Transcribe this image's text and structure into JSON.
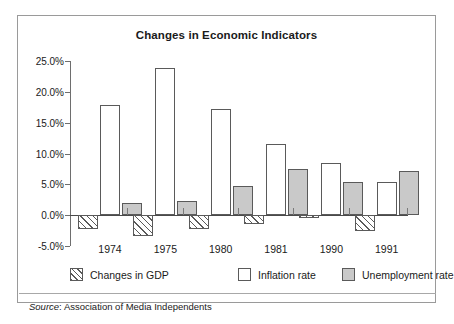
{
  "chart_data": {
    "type": "bar",
    "title": "Changes in Economic Indicators",
    "xlabel": "",
    "ylabel": "",
    "categories": [
      "1974",
      "1975",
      "1980",
      "1981",
      "1990",
      "1991"
    ],
    "series": [
      {
        "name": "Changes in GDP",
        "values": [
          -2.2,
          -3.3,
          -2.2,
          -1.5,
          -0.4,
          -2.6
        ],
        "fill": "hatched"
      },
      {
        "name": "Inflation rate",
        "values": [
          17.9,
          23.9,
          17.2,
          11.5,
          8.4,
          5.4
        ],
        "fill": "white"
      },
      {
        "name": "Unemployment rate",
        "values": [
          2.0,
          2.3,
          4.7,
          7.5,
          5.4,
          7.2
        ],
        "fill": "#c9c9c9"
      }
    ],
    "ylim": [
      -5.0,
      25.0
    ],
    "ytick_values": [
      25.0,
      20.0,
      15.0,
      10.0,
      5.0,
      0.0,
      -5.0
    ],
    "ytick_labels": [
      "25.0%",
      "20.0%",
      "15.0%",
      "10.0%",
      "5.0%",
      "0.0%",
      "-5.0%"
    ],
    "grid": false,
    "legend_position": "bottom",
    "units": "percent"
  },
  "source": {
    "prefix": "Source",
    "separator": ":",
    "text": "Association of Media Independents"
  },
  "colors": {
    "unemployment_fill": "#c9c9c9",
    "bar_outline": "#5a5a5a",
    "axis": "#6e6e6e",
    "frame": "#9a9a9a"
  }
}
